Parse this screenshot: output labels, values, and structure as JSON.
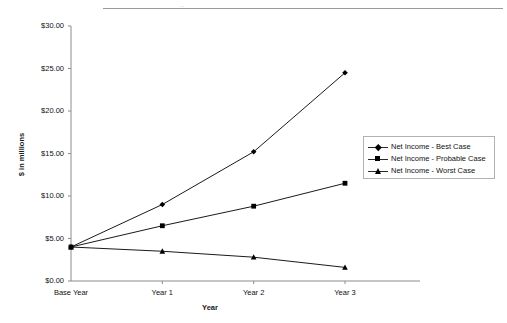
{
  "top_partial_text": "..",
  "chart_data": {
    "type": "line",
    "title": "",
    "xlabel": "Year",
    "ylabel": "$ in millions",
    "categories": [
      "Base Year",
      "Year 1",
      "Year 2",
      "Year 3"
    ],
    "ylim": [
      0,
      30
    ],
    "ytick_step": 5,
    "ytick_labels": [
      "$30.00",
      "$25.00",
      "$20.00",
      "$15.00",
      "$10.00",
      "$5.00",
      "$0.00"
    ],
    "ytick_values": [
      30,
      25,
      20,
      15,
      10,
      5,
      0
    ],
    "grid": false,
    "legend_position": "right",
    "series": [
      {
        "name": "Net Income - Best Case",
        "marker": "diamond",
        "color": "#000000",
        "values": [
          4.0,
          9.0,
          15.2,
          24.5
        ]
      },
      {
        "name": "Net Income - Probable Case",
        "marker": "square",
        "color": "#000000",
        "values": [
          4.0,
          6.5,
          8.8,
          11.5
        ]
      },
      {
        "name": "Net Income - Worst Case",
        "marker": "triangle",
        "color": "#000000",
        "values": [
          4.0,
          3.5,
          2.8,
          1.6
        ]
      }
    ]
  }
}
